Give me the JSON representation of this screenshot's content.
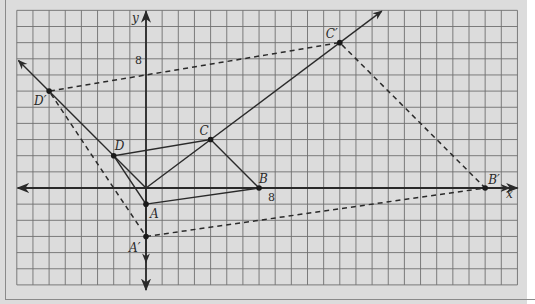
{
  "diagram": {
    "axes": {
      "x_label": "x",
      "y_label": "y",
      "x_tick_label": "8",
      "y_tick_label": "8",
      "unit_px": 16.15
    },
    "origin_px": [
      146,
      188
    ],
    "points": [
      {
        "name": "A",
        "label": "A",
        "x": 0,
        "y": -1
      },
      {
        "name": "B",
        "label": "B",
        "x": 7,
        "y": 0
      },
      {
        "name": "C",
        "label": "C",
        "x": 4,
        "y": 3
      },
      {
        "name": "D",
        "label": "D",
        "x": -2,
        "y": 2
      },
      {
        "name": "A'",
        "label": "A′",
        "x": 0,
        "y": -3
      },
      {
        "name": "B'",
        "label": "B′",
        "x": 21,
        "y": 0
      },
      {
        "name": "C'",
        "label": "C′",
        "x": 12,
        "y": 9
      },
      {
        "name": "D'",
        "label": "D′",
        "x": -6,
        "y": 6
      }
    ],
    "original_polygon": [
      "A",
      "B",
      "C",
      "D"
    ],
    "image_polygon_dashed": [
      "A'",
      "B'",
      "C'",
      "D'"
    ],
    "rays_from_origin": [
      "A",
      "B",
      "C",
      "D"
    ],
    "grid": {
      "x_min": -8,
      "x_max": 23,
      "y_min": -6,
      "y_max": 11
    },
    "colors": {
      "background": "#dcdcdc",
      "grid": "#6f6f6f",
      "lines": "#2a2a2a"
    }
  }
}
